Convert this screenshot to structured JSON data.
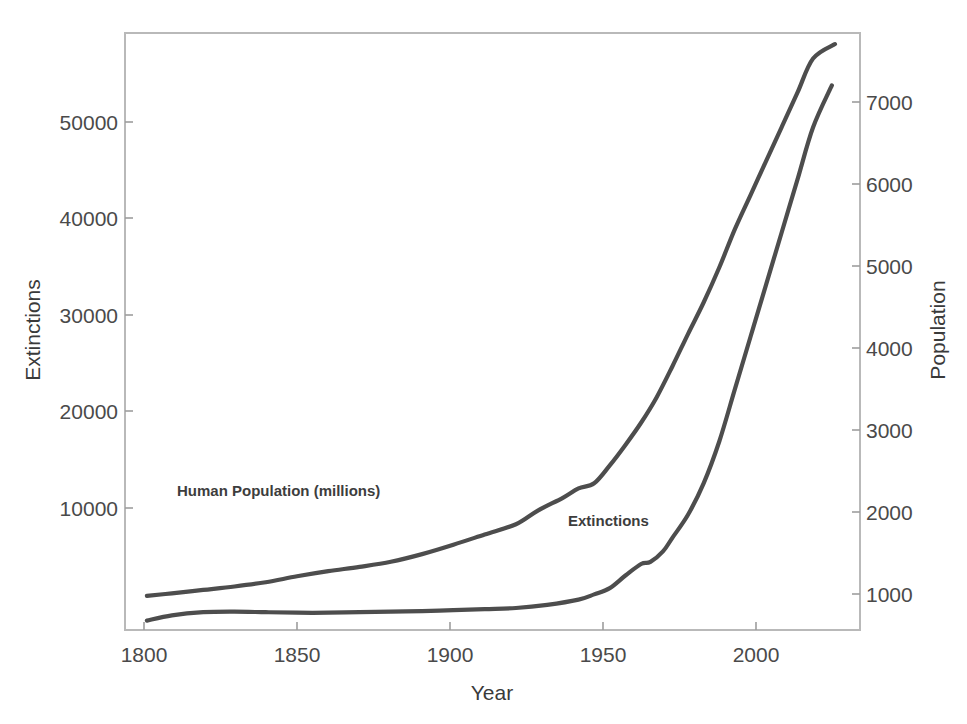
{
  "chart_data": {
    "type": "line",
    "title": "",
    "subtitle": "",
    "xlabel": "Year",
    "ylabel": "Extinctions",
    "y2label": "Population",
    "xlim": [
      1795,
      2030
    ],
    "ylim": [
      0,
      57000
    ],
    "y2lim": [
      600,
      7600
    ],
    "grid": false,
    "legend_position": "inline-annotations",
    "xticks": [
      1800,
      1850,
      1900,
      1950,
      2000
    ],
    "xtick_labels": [
      "1800",
      "1850",
      "1900",
      "1950",
      "2000"
    ],
    "yticks": [
      10000,
      20000,
      30000,
      40000,
      50000
    ],
    "ytick_labels": [
      "10000",
      "20000",
      "30000",
      "40000",
      "50000"
    ],
    "y2ticks": [
      1000,
      2000,
      3000,
      4000,
      5000,
      6000,
      7000
    ],
    "y2tick_labels": [
      "1000",
      "2000",
      "3000",
      "4000",
      "5000",
      "6000",
      "7000"
    ],
    "annotations": [
      {
        "text": "Human Population (millions)",
        "x": 1835,
        "y_axis": "right",
        "y": 2050
      },
      {
        "text": "Extinctions",
        "x": 1930,
        "y_axis": "left",
        "y": 7800
      }
    ],
    "series": [
      {
        "name": "Human Population (millions)",
        "axis": "right",
        "color": "#4d4d4d",
        "x": [
          1802,
          1810,
          1820,
          1830,
          1840,
          1850,
          1860,
          1870,
          1880,
          1890,
          1900,
          1910,
          1920,
          1927,
          1935,
          1940,
          1945,
          1950,
          1955,
          1960,
          1965,
          1970,
          1975,
          1980,
          1985,
          1990,
          1995,
          2000,
          2005,
          2010,
          2015,
          2022
        ],
        "values": [
          1000,
          1030,
          1070,
          1110,
          1160,
          1230,
          1290,
          1340,
          1400,
          1490,
          1600,
          1720,
          1840,
          2000,
          2150,
          2260,
          2320,
          2530,
          2770,
          3030,
          3330,
          3690,
          4070,
          4440,
          4850,
          5300,
          5700,
          6100,
          6500,
          6900,
          7300,
          7470
        ]
      },
      {
        "name": "Extinctions",
        "axis": "left",
        "color": "#4d4d4d",
        "x": [
          1802,
          1810,
          1820,
          1830,
          1840,
          1850,
          1860,
          1870,
          1880,
          1890,
          1900,
          1910,
          1920,
          1930,
          1940,
          1945,
          1950,
          1955,
          1960,
          1963,
          1967,
          1970,
          1975,
          1980,
          1985,
          1990,
          1995,
          2000,
          2005,
          2010,
          2015,
          2021
        ],
        "values": [
          900,
          1400,
          1700,
          1750,
          1700,
          1650,
          1650,
          1700,
          1750,
          1800,
          1900,
          2000,
          2100,
          2400,
          2900,
          3400,
          4000,
          5200,
          6300,
          6500,
          7500,
          8800,
          11000,
          14000,
          18000,
          23000,
          28000,
          33000,
          38000,
          43000,
          48000,
          52000
        ]
      }
    ]
  },
  "axes": {
    "left_title": "Extinctions",
    "right_title": "Population",
    "bottom_title": "Year"
  },
  "labels": {
    "population_inline": "Human Population (millions)",
    "extinctions_inline": "Extinctions"
  },
  "colors": {
    "line": "#4d4d4d",
    "frame": "#b9b9b9",
    "text": "#3f3f3f",
    "background": "#ffffff"
  }
}
